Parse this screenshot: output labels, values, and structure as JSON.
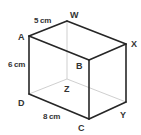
{
  "diagram": {
    "type": "cuboid",
    "vertices": {
      "A": {
        "label": "A",
        "x": 29,
        "y": 36
      },
      "W": {
        "label": "W",
        "x": 67,
        "y": 21
      },
      "X": {
        "label": "X",
        "x": 126,
        "y": 44
      },
      "B": {
        "label": "B",
        "x": 89,
        "y": 60
      },
      "D": {
        "label": "D",
        "x": 29,
        "y": 94
      },
      "Z": {
        "label": "Z",
        "x": 67,
        "y": 79
      },
      "Y": {
        "label": "Y",
        "x": 126,
        "y": 102
      },
      "C": {
        "label": "C",
        "x": 89,
        "y": 119
      }
    },
    "dimensions": {
      "AW": "5 cm",
      "AD": "6 cm",
      "DC": "8 cm"
    },
    "colors": {
      "visible_edge": "#262626",
      "hidden_edge": "#c9c9c9",
      "label": "#333333"
    }
  }
}
